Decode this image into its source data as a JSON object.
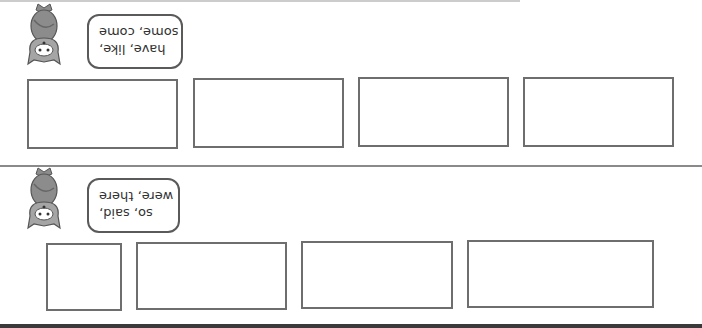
{
  "orientation": "rotated 180 degrees",
  "sections": [
    {
      "speech_bubble": {
        "lines": [
          "have, like,",
          "some, come"
        ]
      },
      "answer_boxes": [
        {
          "label": "box-1"
        },
        {
          "label": "box-2"
        },
        {
          "label": "box-3"
        },
        {
          "label": "box-4"
        }
      ]
    },
    {
      "speech_bubble": {
        "lines": [
          "so, said,",
          "were, there"
        ]
      },
      "answer_boxes": [
        {
          "label": "box-1"
        },
        {
          "label": "box-2"
        },
        {
          "label": "box-3"
        },
        {
          "label": "box-4"
        }
      ]
    }
  ],
  "colors": {
    "box_border": "#6e6e6e",
    "cat_body": "#8c8c8c",
    "divider": "#8a8a8a"
  }
}
